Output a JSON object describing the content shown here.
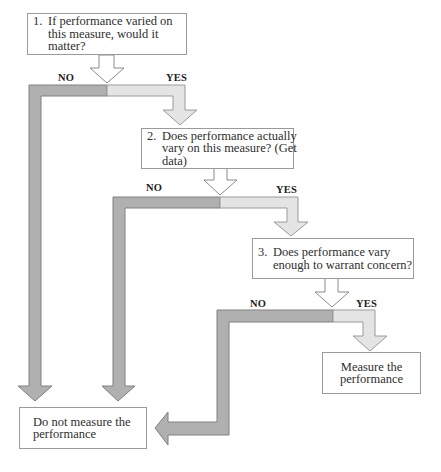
{
  "flowchart": {
    "steps": [
      {
        "number": "1.",
        "lines": [
          "If performance varied on",
          "this measure, would it",
          "matter?"
        ]
      },
      {
        "number": "2.",
        "lines": [
          "Does performance actually",
          "vary on this measure? (Get",
          "data)"
        ]
      },
      {
        "number": "3.",
        "lines": [
          "Does performance vary",
          "enough to warrant concern?"
        ]
      }
    ],
    "outcomes": {
      "measure": {
        "lines": [
          "Measure the",
          "performance"
        ]
      },
      "do_not_measure": {
        "lines": [
          "Do not measure the",
          "performance"
        ]
      }
    },
    "branch_labels": {
      "no": "NO",
      "yes": "YES"
    },
    "colors": {
      "no_path_fill": "#b0b0b0",
      "no_path_stroke": "#808080",
      "yes_path_fill": "#e4e4e4",
      "yes_path_stroke": "#9a9a9a",
      "box_border": "#9a9a9a"
    }
  }
}
